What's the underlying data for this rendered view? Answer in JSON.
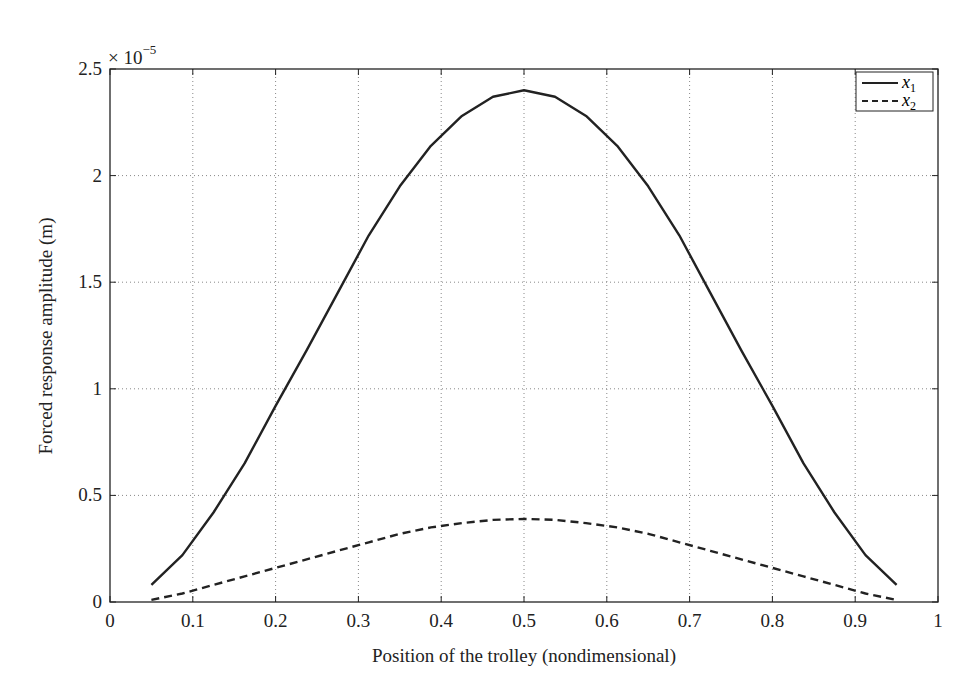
{
  "chart_data": {
    "type": "line",
    "title": "",
    "xlabel": "Position of the trolley (nondimensional)",
    "ylabel": "Forced response amplitude (m)",
    "y_multiplier": "× 10",
    "y_exponent": "−5",
    "xlim": [
      0,
      1
    ],
    "ylim": [
      0,
      2.5
    ],
    "xticks": [
      0,
      0.1,
      0.2,
      0.3,
      0.4,
      0.5,
      0.6,
      0.7,
      0.8,
      0.9,
      1
    ],
    "xtick_labels": [
      "0",
      "0.1",
      "0.2",
      "0.3",
      "0.4",
      "0.5",
      "0.6",
      "0.7",
      "0.8",
      "0.9",
      "1"
    ],
    "yticks": [
      0,
      0.5,
      1,
      1.5,
      2,
      2.5
    ],
    "ytick_labels": [
      "0",
      "0.5",
      "1",
      "1.5",
      "2",
      "2.5"
    ],
    "grid": true,
    "legend_position": "upper right",
    "x": [
      0.05,
      0.0875,
      0.125,
      0.1625,
      0.2,
      0.2375,
      0.275,
      0.3125,
      0.35,
      0.3875,
      0.425,
      0.4625,
      0.5,
      0.5375,
      0.575,
      0.6125,
      0.65,
      0.6875,
      0.725,
      0.7625,
      0.8,
      0.8375,
      0.875,
      0.9125,
      0.95
    ],
    "series": [
      {
        "name": "x1",
        "label_base": "x",
        "label_sub": "1",
        "style": "solid",
        "values": [
          0.08,
          0.22,
          0.42,
          0.65,
          0.92,
          1.18,
          1.45,
          1.72,
          1.95,
          2.14,
          2.28,
          2.37,
          2.4,
          2.37,
          2.28,
          2.14,
          1.95,
          1.72,
          1.45,
          1.18,
          0.92,
          0.65,
          0.42,
          0.22,
          0.08
        ]
      },
      {
        "name": "x2",
        "label_base": "x",
        "label_sub": "2",
        "style": "dashed",
        "values": [
          0.01,
          0.04,
          0.08,
          0.12,
          0.16,
          0.2,
          0.24,
          0.28,
          0.32,
          0.35,
          0.37,
          0.385,
          0.39,
          0.385,
          0.37,
          0.35,
          0.32,
          0.28,
          0.24,
          0.2,
          0.16,
          0.12,
          0.08,
          0.04,
          0.01
        ]
      }
    ]
  }
}
